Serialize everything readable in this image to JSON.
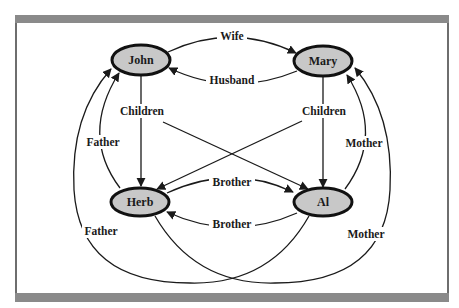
{
  "diagram": {
    "type": "family-relationship-graph",
    "colors": {
      "node_fill": "#c8c8c8",
      "node_stroke": "#111111",
      "frame_bar": "#8a8a8a",
      "edge": "#1a1a1a"
    },
    "nodes": [
      {
        "id": "john",
        "label": "John",
        "cx": 141,
        "cy": 60
      },
      {
        "id": "mary",
        "label": "Mary",
        "cx": 323,
        "cy": 61
      },
      {
        "id": "herb",
        "label": "Herb",
        "cx": 140,
        "cy": 202
      },
      {
        "id": "al",
        "label": "Al",
        "cx": 323,
        "cy": 202
      }
    ],
    "edges": [
      {
        "from": "john",
        "to": "mary",
        "label": "Wife"
      },
      {
        "from": "mary",
        "to": "john",
        "label": "Husband"
      },
      {
        "from": "john",
        "to": "herb",
        "label": "Children"
      },
      {
        "from": "john",
        "to": "al",
        "label": "Children"
      },
      {
        "from": "mary",
        "to": "al",
        "label": "Children"
      },
      {
        "from": "mary",
        "to": "herb",
        "label": "Children"
      },
      {
        "from": "herb",
        "to": "al",
        "label": "Brother"
      },
      {
        "from": "al",
        "to": "herb",
        "label": "Brother"
      },
      {
        "from": "herb",
        "to": "john",
        "label": "Father"
      },
      {
        "from": "al",
        "to": "john",
        "label": "Father"
      },
      {
        "from": "al",
        "to": "mary",
        "label": "Mother"
      },
      {
        "from": "herb",
        "to": "mary",
        "label": "Mother"
      }
    ],
    "labels": {
      "john": "John",
      "mary": "Mary",
      "herb": "Herb",
      "al": "Al",
      "wife": "Wife",
      "husband": "Husband",
      "children_left": "Children",
      "children_right": "Children",
      "brother_top": "Brother",
      "brother_bottom": "Brother",
      "father_inner": "Father",
      "father_outer": "Father",
      "mother_inner": "Mother",
      "mother_outer": "Mother"
    }
  }
}
